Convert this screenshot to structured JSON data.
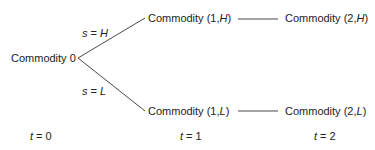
{
  "diagram": {
    "type": "tree",
    "nodes": [
      {
        "id": "c0",
        "label": "Commodity 0"
      },
      {
        "id": "c1H",
        "label_prefix": "Commodity (1,",
        "state": "H",
        "label_suffix": ")"
      },
      {
        "id": "c2H",
        "label_prefix": "Commodity (2,",
        "state": "H",
        "label_suffix": ")"
      },
      {
        "id": "c1L",
        "label_prefix": "Commodity (1,",
        "state": "L",
        "label_suffix": ")"
      },
      {
        "id": "c2L",
        "label_prefix": "Commodity (2,",
        "state": "L",
        "label_suffix": ")"
      }
    ],
    "edges": [
      {
        "from": "c0",
        "to": "c1H",
        "var": "s",
        "eq": " = ",
        "value": "H"
      },
      {
        "from": "c0",
        "to": "c1L",
        "var": "s",
        "eq": " = ",
        "value": "L"
      },
      {
        "from": "c1H",
        "to": "c2H"
      },
      {
        "from": "c1L",
        "to": "c2L"
      }
    ],
    "time_axis": [
      {
        "var": "t",
        "eq": " = ",
        "value": "0"
      },
      {
        "var": "t",
        "eq": " = ",
        "value": "1"
      },
      {
        "var": "t",
        "eq": " = ",
        "value": "2"
      }
    ],
    "line_color": "#333333",
    "text_color": "#222222"
  }
}
